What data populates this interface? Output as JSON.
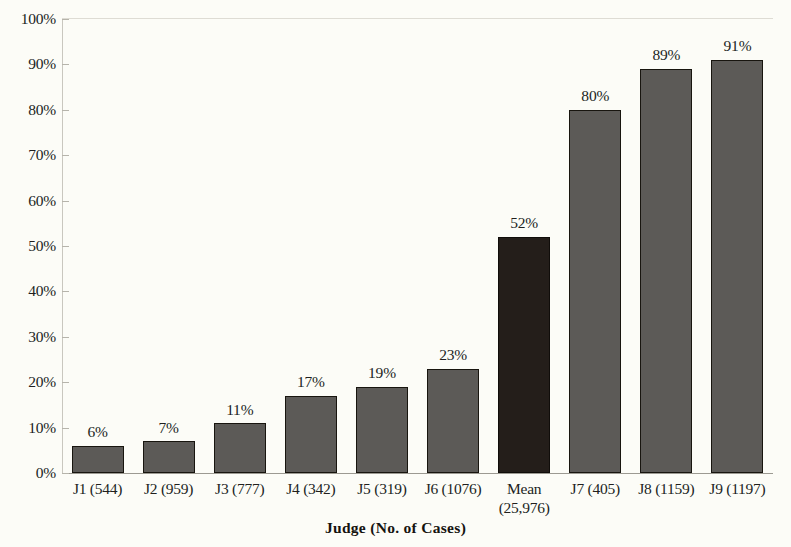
{
  "chart_data": {
    "type": "bar",
    "title": "",
    "subtitle": "",
    "xlabel": "Judge (No. of Cases)",
    "ylabel": "",
    "ylim": [
      0,
      100
    ],
    "y_unit": "%",
    "grid": false,
    "legend": "none",
    "y_ticks": [
      "0%",
      "10%",
      "20%",
      "30%",
      "40%",
      "50%",
      "60%",
      "70%",
      "80%",
      "90%",
      "100%"
    ],
    "y_tick_values": [
      0,
      10,
      20,
      30,
      40,
      50,
      60,
      70,
      80,
      90,
      100
    ],
    "categories": [
      "J1 (544)",
      "J2 (959)",
      "J3 (777)",
      "J4 (342)",
      "J5 (319)",
      "J6 (1076)",
      "Mean (25,976)",
      "J7 (405)",
      "J8 (1159)",
      "J9 (1197)"
    ],
    "values": [
      6,
      7,
      11,
      17,
      19,
      23,
      52,
      80,
      89,
      91
    ],
    "data_labels": [
      "6%",
      "7%",
      "11%",
      "17%",
      "19%",
      "23%",
      "52%",
      "80%",
      "89%",
      "91%"
    ],
    "bars": [
      {
        "label_line1": "J1 (544)",
        "label_line2": "",
        "value": 6,
        "data_label": "6%",
        "highlight": false
      },
      {
        "label_line1": "J2 (959)",
        "label_line2": "",
        "value": 7,
        "data_label": "7%",
        "highlight": false
      },
      {
        "label_line1": "J3 (777)",
        "label_line2": "",
        "value": 11,
        "data_label": "11%",
        "highlight": false
      },
      {
        "label_line1": "J4 (342)",
        "label_line2": "",
        "value": 17,
        "data_label": "17%",
        "highlight": false
      },
      {
        "label_line1": "J5 (319)",
        "label_line2": "",
        "value": 19,
        "data_label": "19%",
        "highlight": false
      },
      {
        "label_line1": "J6 (1076)",
        "label_line2": "",
        "value": 23,
        "data_label": "23%",
        "highlight": false
      },
      {
        "label_line1": "Mean",
        "label_line2": "(25,976)",
        "value": 52,
        "data_label": "52%",
        "highlight": true
      },
      {
        "label_line1": "J7 (405)",
        "label_line2": "",
        "value": 80,
        "data_label": "80%",
        "highlight": false
      },
      {
        "label_line1": "J8 (1159)",
        "label_line2": "",
        "value": 89,
        "data_label": "89%",
        "highlight": false
      },
      {
        "label_line1": "J9 (1197)",
        "label_line2": "",
        "value": 91,
        "data_label": "91%",
        "highlight": false
      }
    ],
    "colors": {
      "bar_fill": "#5c5a57",
      "bar_outline": "#18150f",
      "highlight_fill": "#241e1a",
      "background": "#fcfcf7",
      "text": "#211f1d"
    }
  }
}
